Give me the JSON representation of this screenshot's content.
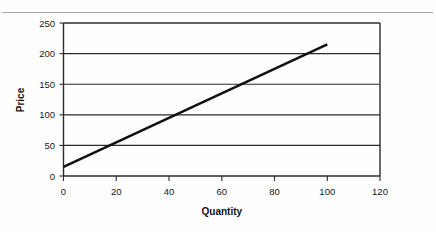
{
  "page": {
    "background_color": "#fefefe",
    "top_rule_color": "#a8a8a8"
  },
  "chart_data": {
    "type": "line",
    "title": "",
    "subtitle": "",
    "xlabel": "Quantity",
    "ylabel": "Price",
    "xlim": [
      0,
      120
    ],
    "ylim": [
      0,
      250
    ],
    "xticks": [
      0,
      20,
      40,
      60,
      80,
      100,
      120
    ],
    "xtick_labels": [
      "0",
      "20",
      "40",
      "60",
      "80",
      "100",
      "120"
    ],
    "yticks": [
      0,
      50,
      100,
      150,
      200,
      250
    ],
    "ytick_labels": [
      "0",
      "50",
      "100",
      "150",
      "200",
      "250"
    ],
    "grid": {
      "horizontal": true,
      "vertical": false,
      "color": "#2b2b2b"
    },
    "legend": {
      "visible": false,
      "position": "none",
      "entries": []
    },
    "annotations": [],
    "series": [
      {
        "name": "Supply",
        "color": "#111111",
        "line_width": 2.6,
        "x": [
          0,
          20,
          40,
          60,
          80,
          100
        ],
        "values": [
          15,
          55,
          95,
          135,
          175,
          215
        ],
        "equation": "P = 15 + 2Q"
      }
    ]
  },
  "axes": {
    "y_title": "Price",
    "x_title": "Quantity"
  }
}
